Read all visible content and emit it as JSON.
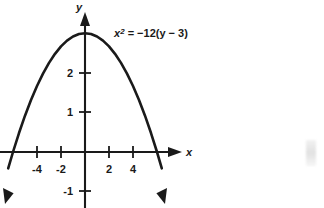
{
  "figure": {
    "title": "",
    "equation": {
      "base": "x",
      "exponent": "2",
      "rest": " = −12(y − 3)",
      "full": "x² = −12(y − 3)"
    },
    "axis_labels": {
      "x": "x",
      "y": "y"
    },
    "stroke_color": "#1a1a1a",
    "background_color": "#ffffff"
  },
  "chart_data": {
    "type": "line",
    "title": "",
    "xlabel": "x",
    "ylabel": "y",
    "grid": false,
    "legend": null,
    "annotations": [
      {
        "text": "x² = −12(y − 3)",
        "x": 2.0,
        "y": 3.05
      }
    ],
    "equation": "x^2 = -12(y - 3)",
    "vertex": [
      0,
      3
    ],
    "x_intercepts": [
      -6,
      6
    ],
    "y_intercept": 3,
    "xlim": [
      -7.1,
      6.6
    ],
    "ylim": [
      -1.45,
      3.45
    ],
    "x_ticks": [
      -4,
      -2,
      2,
      4
    ],
    "x_tick_labels": [
      "-4",
      "-2",
      "2",
      "4"
    ],
    "y_ticks": [
      1,
      2,
      -1
    ],
    "y_tick_labels": [
      "1",
      "2",
      "-1"
    ],
    "series": [
      {
        "name": "x^2 = -12(y - 3)",
        "color": "#1a1a1a",
        "x": [
          -6.4,
          -6.0,
          -5.5,
          -5.0,
          -4.5,
          -4.0,
          -3.5,
          -3.0,
          -2.5,
          -2.0,
          -1.5,
          -1.0,
          -0.5,
          0.0,
          0.5,
          1.0,
          1.5,
          2.0,
          2.5,
          3.0,
          3.5,
          4.0,
          4.5,
          5.0,
          5.5,
          6.0,
          6.4
        ],
        "y": [
          -0.413,
          0.0,
          0.479,
          0.917,
          1.313,
          1.667,
          1.979,
          2.25,
          2.479,
          2.667,
          2.813,
          2.917,
          2.979,
          3.0,
          2.979,
          2.917,
          2.813,
          2.667,
          2.479,
          2.25,
          1.979,
          1.667,
          1.313,
          0.917,
          0.479,
          0.0,
          -0.413
        ]
      }
    ]
  }
}
